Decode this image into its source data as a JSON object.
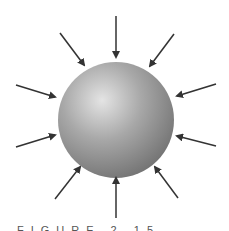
{
  "figure": {
    "caption": "FIGURE 2.15",
    "sphere": {
      "cx": 116,
      "cy": 120,
      "r": 58,
      "highlight": "#e4e4e4",
      "mid": "#a8a8a8",
      "shadow": "#6e6e6e"
    },
    "arrow_color": "#333333",
    "arrows": [
      {
        "x1": 116,
        "y1": 16,
        "x2": 116,
        "y2": 57
      },
      {
        "x1": 60,
        "y1": 33,
        "x2": 84,
        "y2": 65
      },
      {
        "x1": 174,
        "y1": 34,
        "x2": 150,
        "y2": 66
      },
      {
        "x1": 16,
        "y1": 85,
        "x2": 55,
        "y2": 97
      },
      {
        "x1": 216,
        "y1": 84,
        "x2": 177,
        "y2": 96
      },
      {
        "x1": 16,
        "y1": 147,
        "x2": 55,
        "y2": 135
      },
      {
        "x1": 216,
        "y1": 146,
        "x2": 177,
        "y2": 136
      },
      {
        "x1": 55,
        "y1": 199,
        "x2": 80,
        "y2": 167
      },
      {
        "x1": 178,
        "y1": 198,
        "x2": 155,
        "y2": 167
      },
      {
        "x1": 116,
        "y1": 218,
        "x2": 116,
        "y2": 178
      }
    ]
  }
}
